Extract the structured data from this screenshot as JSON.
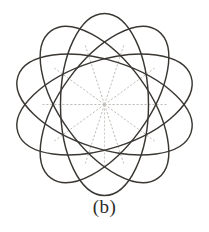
{
  "figure": {
    "caption": "(b)",
    "center": {
      "x": 104.5,
      "y": 104.5
    },
    "background_color": "#ffffff",
    "stroke_color": "#3a3733",
    "spoke_color": "#b9b5ae",
    "ellipse": {
      "count": 5,
      "rx": 44,
      "ry": 91,
      "rotation_step_deg": 36,
      "rotations_deg": [
        0,
        36,
        72,
        108,
        144
      ]
    },
    "spokes": {
      "count": 10,
      "radius": 62,
      "angles_deg": [
        0,
        36,
        72,
        108,
        144,
        180,
        216,
        252,
        288,
        324
      ],
      "style": "dashed"
    }
  }
}
